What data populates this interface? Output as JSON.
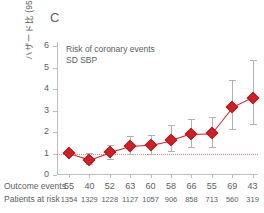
{
  "panel": {
    "letter": "C"
  },
  "title": {
    "line1": "Risk of coronary events",
    "line2": "SD SBP"
  },
  "axes": {
    "ylabel": "ハザード比 (95% CI)",
    "yticks": [
      "6",
      "5",
      "4",
      "3",
      "2",
      "1",
      "0"
    ],
    "ymin": 0,
    "ymax": 6.2,
    "reference_line_value": 1
  },
  "table": {
    "row1_label": "Outcome events",
    "row2_label": "Patients at risk",
    "outcome_events": [
      "55",
      "40",
      "52",
      "63",
      "60",
      "58",
      "66",
      "55",
      "69",
      "43"
    ],
    "patients_at_risk": [
      "1354",
      "1329",
      "1228",
      "1127",
      "1057",
      "906",
      "858",
      "713",
      "560",
      "319"
    ]
  },
  "colors": {
    "marker": "#cf2027",
    "line": "#cf2027",
    "ci": "#aeb4b5",
    "axis": "#b9bfc0",
    "reference": "#d08a7e",
    "text": "#5a6163"
  },
  "chart_data": {
    "type": "line",
    "title": "Risk of coronary events",
    "subtitle": "SD SBP",
    "xlabel": "",
    "ylabel": "ハザード比 (95% CI)",
    "ylim": [
      0,
      6.2
    ],
    "grid": false,
    "legend": "none",
    "reference_line": 1,
    "x": [
      1,
      2,
      3,
      4,
      5,
      6,
      7,
      8,
      9,
      10
    ],
    "series": [
      {
        "name": "Hazard ratio",
        "values": [
          1.02,
          0.72,
          1.06,
          1.34,
          1.4,
          1.61,
          1.93,
          1.95,
          3.15,
          3.6
        ],
        "ci_low": [
          0.99,
          0.5,
          0.74,
          0.96,
          0.99,
          1.12,
          1.3,
          1.3,
          2.16,
          2.38
        ],
        "ci_high": [
          1.06,
          1.02,
          1.38,
          1.83,
          1.86,
          2.32,
          2.62,
          2.72,
          4.45,
          5.38
        ]
      }
    ],
    "annotations": [
      {
        "text": "C",
        "position": "top-left"
      }
    ]
  }
}
